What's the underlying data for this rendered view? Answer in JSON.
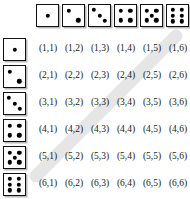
{
  "figure": {
    "name": "dice-sample-space-table",
    "background_color": "#ffffff",
    "text_color": "#1a1a1a",
    "pip_color": "#000000",
    "die_border_color": "#111111",
    "die_shadow_color": "#b9b9b9",
    "highlight_color": "#e2e2e2"
  },
  "highlight": {
    "name": "sum-seven-diagonal",
    "color": "#e2e2e2",
    "opacity": 0.85,
    "cells": [
      "(1,6)",
      "(2,5)",
      "(3,4)",
      "(4,3)",
      "(5,2)",
      "(6,1)"
    ],
    "x1": 176,
    "y1": 36,
    "x2": 36,
    "y2": 176,
    "thickness": 13
  },
  "header_row": {
    "label": "column-die-faces",
    "faces": [
      1,
      2,
      3,
      4,
      5,
      6
    ]
  },
  "header_col": {
    "label": "row-die-faces",
    "faces": [
      1,
      2,
      3,
      4,
      5,
      6
    ]
  },
  "pip_layouts": {
    "1": [
      [
        50,
        50
      ]
    ],
    "2": [
      [
        27,
        27
      ],
      [
        73,
        73
      ]
    ],
    "3": [
      [
        24,
        24
      ],
      [
        50,
        50
      ],
      [
        76,
        76
      ]
    ],
    "4": [
      [
        28,
        28
      ],
      [
        72,
        28
      ],
      [
        28,
        72
      ],
      [
        72,
        72
      ]
    ],
    "5": [
      [
        27,
        27
      ],
      [
        73,
        27
      ],
      [
        50,
        50
      ],
      [
        27,
        73
      ],
      [
        73,
        73
      ]
    ],
    "6": [
      [
        29,
        22
      ],
      [
        71,
        22
      ],
      [
        29,
        50
      ],
      [
        71,
        50
      ],
      [
        29,
        78
      ],
      [
        71,
        78
      ]
    ]
  },
  "chart_data": {
    "type": "table",
    "title": "",
    "xlabel": "",
    "ylabel": "",
    "row_categories": [
      1,
      2,
      3,
      4,
      5,
      6
    ],
    "column_categories": [
      1,
      2,
      3,
      4,
      5,
      6
    ],
    "rows": [
      [
        "(1,1)",
        "(1,2)",
        "(1,3)",
        "(1,4)",
        "(1,5)",
        "(1,6)"
      ],
      [
        "(2,1)",
        "(2,2)",
        "(2,3)",
        "(2,4)",
        "(2,5)",
        "(2,6)"
      ],
      [
        "(3,1)",
        "(3,2)",
        "(3,3)",
        "(3,4)",
        "(3,5)",
        "(3,6)"
      ],
      [
        "(4,1)",
        "(4,2)",
        "(4,3)",
        "(4,4)",
        "(4,5)",
        "(4,6)"
      ],
      [
        "(5,1)",
        "(5,2)",
        "(5,3)",
        "(5,4)",
        "(5,5)",
        "(5,6)"
      ],
      [
        "(6,1)",
        "(6,2)",
        "(6,3)",
        "(6,4)",
        "(6,5)",
        "(6,6)"
      ]
    ],
    "highlighted_cells": [
      "(1,6)",
      "(2,5)",
      "(3,4)",
      "(4,3)",
      "(5,2)",
      "(6,1)"
    ],
    "grid": false,
    "legend": "none"
  },
  "geometry": {
    "col_pitch": 26,
    "row_pitch": 27,
    "die_size": 23,
    "cells_left": 35,
    "cells_top": 37,
    "header_row_top": 4,
    "header_col_left": 3
  }
}
